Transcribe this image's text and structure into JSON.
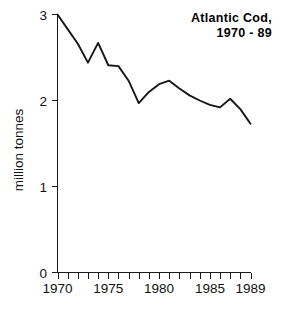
{
  "chart_data": {
    "type": "line",
    "title": "Atlantic Cod,",
    "subtitle": "1970 - 89",
    "xlabel": "",
    "ylabel": "million tonnes",
    "xlim": [
      1970,
      1989
    ],
    "ylim": [
      0,
      3
    ],
    "grid": false,
    "legend": "none",
    "line_color": "#161616",
    "x": [
      1970,
      1971,
      1972,
      1973,
      1974,
      1975,
      1976,
      1977,
      1978,
      1979,
      1980,
      1981,
      1982,
      1983,
      1984,
      1985,
      1986,
      1987,
      1988,
      1989
    ],
    "values": [
      3.0,
      2.83,
      2.66,
      2.44,
      2.67,
      2.41,
      2.4,
      2.23,
      1.97,
      2.1,
      2.19,
      2.23,
      2.14,
      2.06,
      2.0,
      1.95,
      1.92,
      2.02,
      1.9,
      1.73
    ],
    "series": [
      {
        "name": "Atlantic Cod catch",
        "values": [
          3.0,
          2.83,
          2.66,
          2.44,
          2.67,
          2.41,
          2.4,
          2.23,
          1.97,
          2.1,
          2.19,
          2.23,
          2.14,
          2.06,
          2.0,
          1.95,
          1.92,
          2.02,
          1.9,
          1.73
        ]
      }
    ],
    "y_ticks": [
      0,
      1,
      2,
      3
    ],
    "y_tick_labels": [
      "0",
      "1",
      "2",
      "3"
    ],
    "x_ticks": [
      1970,
      1971,
      1972,
      1973,
      1974,
      1975,
      1976,
      1977,
      1978,
      1979,
      1980,
      1981,
      1982,
      1983,
      1984,
      1985,
      1986,
      1987,
      1988,
      1989
    ],
    "x_tick_labels": [
      "1970",
      "1975",
      "1980",
      "1985",
      "1989"
    ],
    "x_tick_label_years": [
      1970,
      1975,
      1980,
      1985,
      1989
    ]
  },
  "axis": {
    "y_label": "million tonnes",
    "y_tick_0": "0",
    "y_tick_1": "1",
    "y_tick_2": "2",
    "y_tick_3": "3",
    "x_tick_1970": "1970",
    "x_tick_1975": "1975",
    "x_tick_1980": "1980",
    "x_tick_1985": "1985",
    "x_tick_1989": "1989"
  },
  "title": {
    "line1": "Atlantic Cod,",
    "line2": "1970 - 89"
  }
}
